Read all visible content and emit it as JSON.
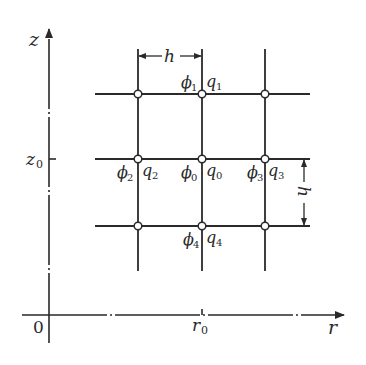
{
  "diagram": {
    "type": "finite-difference-grid",
    "axes": {
      "vertical": {
        "label": "z",
        "tick_label": "z",
        "tick_sub": "0"
      },
      "horizontal": {
        "label": "r",
        "tick_label": "r",
        "tick_sub": "0"
      },
      "origin_label": "0"
    },
    "spacing_label": "h",
    "nodes": [
      {
        "phi": "ϕ",
        "phi_sub": "1",
        "q": "q",
        "q_sub": "1",
        "position": "top"
      },
      {
        "phi": "ϕ",
        "phi_sub": "2",
        "q": "q",
        "q_sub": "2",
        "position": "left"
      },
      {
        "phi": "ϕ",
        "phi_sub": "0",
        "q": "q",
        "q_sub": "0",
        "position": "center"
      },
      {
        "phi": "ϕ",
        "phi_sub": "3",
        "q": "q",
        "q_sub": "3",
        "position": "right"
      },
      {
        "phi": "ϕ",
        "phi_sub": "4",
        "q": "q",
        "q_sub": "4",
        "position": "bottom"
      }
    ],
    "colors": {
      "line": "#2a2a2a",
      "background": "#ffffff"
    }
  }
}
